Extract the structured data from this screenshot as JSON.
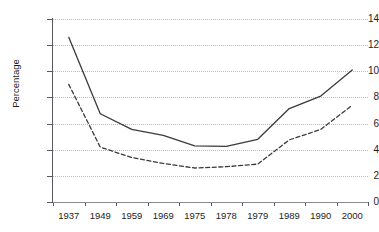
{
  "chart_data": {
    "type": "line",
    "title": "",
    "xlabel": "",
    "ylabel": "Percentage",
    "categories": [
      "1937",
      "1949",
      "1959",
      "1969",
      "1975",
      "1978",
      "1979",
      "1989",
      "1990",
      "2000"
    ],
    "ylim": [
      0,
      14
    ],
    "y_ticks": [
      "0",
      "2",
      "4",
      "6",
      "8",
      "10",
      "12",
      "14"
    ],
    "grid": "horizontal-dotted",
    "legend": "none",
    "series": [
      {
        "name": "solid-series",
        "style": "solid",
        "color": "#3a3a3a",
        "values": [
          12.6,
          6.75,
          5.55,
          5.1,
          4.3,
          4.25,
          4.8,
          7.15,
          8.1,
          10.1
        ]
      },
      {
        "name": "dashed-series",
        "style": "dashed",
        "color": "#3a3a3a",
        "values": [
          9.0,
          4.2,
          3.4,
          2.95,
          2.6,
          2.7,
          2.9,
          4.75,
          5.55,
          7.4
        ]
      }
    ]
  }
}
